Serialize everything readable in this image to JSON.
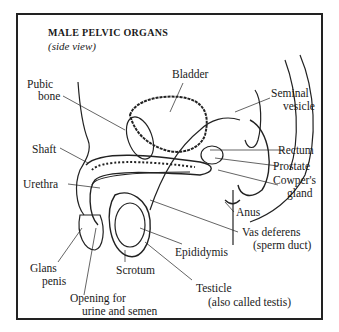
{
  "title": "MALE PELVIC ORGANS",
  "subtitle": "(side view)",
  "labels": {
    "bladder": "Bladder",
    "pubic_bone_1": "Pubic",
    "pubic_bone_2": "bone",
    "seminal_vesicle_1": "Seminal",
    "seminal_vesicle_2": "vesicle",
    "rectum": "Rectum",
    "shaft": "Shaft",
    "prostate": "Prostate",
    "cowpers_1": "Cowper's",
    "cowpers_2": "gland",
    "urethra": "Urethra",
    "anus": "Anus",
    "vas_1": "Vas deferens",
    "vas_2": "(sperm duct)",
    "epididymis": "Epididymis",
    "glans_1": "Glans",
    "glans_2": "penis",
    "scrotum": "Scrotum",
    "testicle_1": "Testicle",
    "testicle_2": "(also called testis)",
    "opening_1": "Opening for",
    "opening_2": "urine and semen"
  }
}
